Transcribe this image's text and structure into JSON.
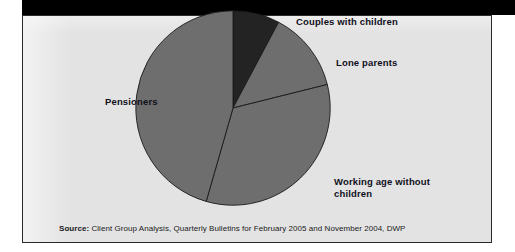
{
  "chart_data": {
    "type": "pie",
    "title": "",
    "categories": [
      "Couples with children",
      "Lone parents",
      "Working age without children",
      "Pensioners"
    ],
    "values": [
      7.8,
      13.3,
      33.3,
      45.6
    ],
    "start_angle_deg": 0,
    "direction": "clockwise",
    "legend_position": "callout-labels",
    "grid": false,
    "slices": [
      {
        "label": "Couples with children",
        "value": 7.8,
        "start_deg": 0,
        "end_deg": 28,
        "color": "#232323"
      },
      {
        "label": "Lone parents",
        "value": 13.3,
        "start_deg": 28,
        "end_deg": 76,
        "color": "#6e6e6e"
      },
      {
        "label": "Working age without children",
        "value": 33.3,
        "start_deg": 76,
        "end_deg": 196,
        "color": "#6e6e6e"
      },
      {
        "label": "Pensioners",
        "value": 45.6,
        "start_deg": 196,
        "end_deg": 360,
        "color": "#6e6e6e"
      }
    ]
  },
  "labels": {
    "couples": "Couples with children",
    "lone_parents": "Lone parents",
    "pensioners": "Pensioners",
    "working_age": "Working age without\nchildren"
  },
  "source": {
    "key": "Source:",
    "text": " Client Group Analysis, Quarterly Bulletins for February 2005 and November 2004, DWP"
  },
  "colors": {
    "dark_slice": "#232323",
    "gray_slice": "#6e6e6e",
    "panel_background": "#e3e3e3",
    "panel_border": "#2a2a2a",
    "top_bar": "#000000",
    "label_text": "#10101c"
  }
}
